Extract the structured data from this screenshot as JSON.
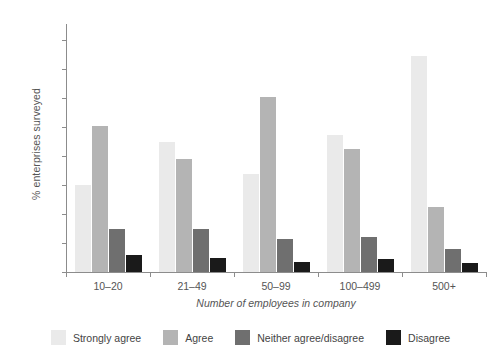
{
  "chart_data": {
    "type": "bar",
    "title": "",
    "xlabel": "Number of employees in company",
    "ylabel": "% enterprises surveyed",
    "categories": [
      "10–20",
      "21–49",
      "50–99",
      "100–499",
      "500+"
    ],
    "series": [
      {
        "name": "Strongly agree",
        "color": "#eaeaea",
        "values": [
          30,
          45,
          34,
          47.5,
          74.5
        ]
      },
      {
        "name": "Agree",
        "color": "#b4b4b4",
        "values": [
          50.5,
          39,
          60.5,
          42.5,
          22.5
        ]
      },
      {
        "name": "Neither agree/disagree",
        "color": "#6f6f6f",
        "values": [
          15,
          15,
          11.5,
          12,
          8
        ]
      },
      {
        "name": "Disagree",
        "color": "#1a1a1a",
        "values": [
          6,
          5,
          3.5,
          4.5,
          3
        ]
      }
    ],
    "ylim": [
      0,
      85
    ],
    "yticks": [
      0,
      10,
      20,
      30,
      40,
      50,
      60,
      70,
      80
    ],
    "ytick_labels": [
      "0",
      "10",
      "20",
      "30",
      "40",
      "50",
      "60",
      "70",
      "80"
    ],
    "grid": false,
    "legend_position": "bottom"
  }
}
